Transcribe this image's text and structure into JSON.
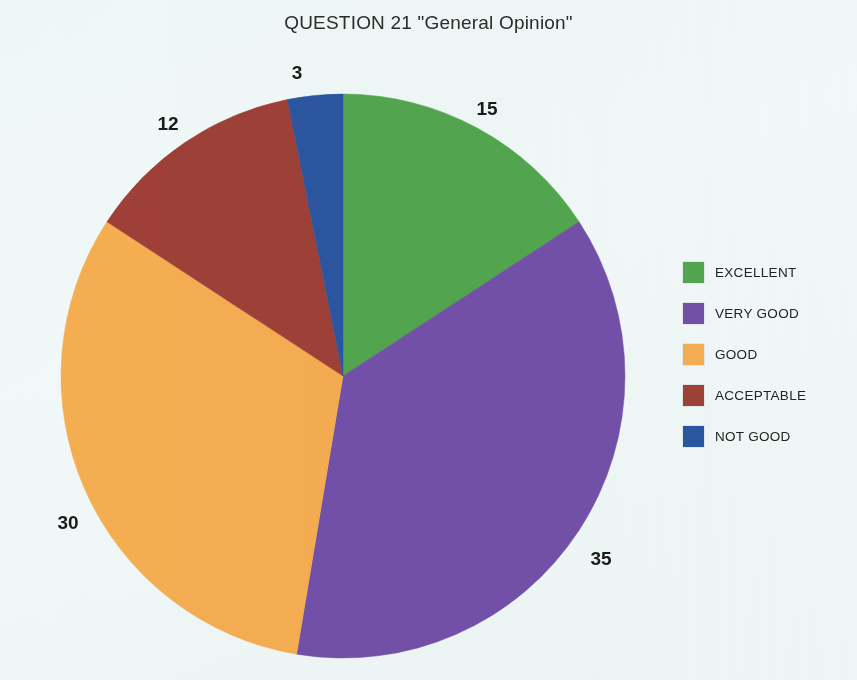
{
  "chart_data": {
    "type": "pie",
    "title": "QUESTION 21 \"General Opinion\"",
    "xlabel": "",
    "ylabel": "",
    "total": 95,
    "start_angle_deg": 0,
    "direction": "clockwise",
    "legend_position": "right",
    "grid": false,
    "categories": [
      "EXCELLENT",
      "VERY GOOD",
      "GOOD",
      "ACCEPTABLE",
      "NOT GOOD"
    ],
    "values": [
      15,
      35,
      30,
      12,
      3
    ],
    "colors": [
      "#52a54f",
      "#7350a8",
      "#f5ad52",
      "#9e4038",
      "#2b55a0"
    ],
    "slices": [
      {
        "label": "EXCELLENT",
        "value": 15,
        "color": "#52a54f",
        "data_label": "15",
        "label_x": 487,
        "label_y": 109
      },
      {
        "label": "VERY GOOD",
        "value": 35,
        "color": "#7350a8",
        "data_label": "35",
        "label_x": 601,
        "label_y": 559
      },
      {
        "label": "GOOD",
        "value": 30,
        "color": "#f5ad52",
        "data_label": "30",
        "label_x": 68,
        "label_y": 523
      },
      {
        "label": "ACCEPTABLE",
        "value": 12,
        "color": "#9e4038",
        "data_label": "12",
        "label_x": 168,
        "label_y": 124
      },
      {
        "label": "NOT GOOD",
        "value": 3,
        "color": "#2b55a0",
        "data_label": "3",
        "label_x": 297,
        "label_y": 73
      }
    ],
    "geometry": {
      "cx": 343,
      "cy": 376,
      "r": 282
    }
  },
  "background_color": "#eff7f6",
  "legend": {
    "items": [
      {
        "label": "EXCELLENT",
        "color": "#52a54f"
      },
      {
        "label": "VERY GOOD",
        "color": "#7350a8"
      },
      {
        "label": "GOOD",
        "color": "#f5ad52"
      },
      {
        "label": "ACCEPTABLE",
        "color": "#9e4038"
      },
      {
        "label": "NOT GOOD",
        "color": "#2b55a0"
      }
    ]
  }
}
